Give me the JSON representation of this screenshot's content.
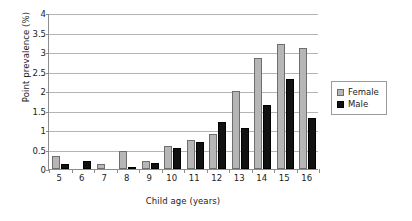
{
  "chart_data": {
    "type": "bar",
    "title": "",
    "xlabel": "Child age (years)",
    "ylabel": "Point prevalence (%)",
    "categories": [
      "5",
      "6",
      "7",
      "8",
      "9",
      "10",
      "11",
      "12",
      "13",
      "14",
      "15",
      "16"
    ],
    "series": [
      {
        "name": "Female",
        "color": "#b6b6b6",
        "values": [
          0.33,
          0.0,
          0.13,
          0.45,
          0.2,
          0.6,
          0.75,
          0.9,
          2.0,
          2.85,
          3.2,
          3.1
        ]
      },
      {
        "name": "Male",
        "color": "#111111",
        "values": [
          0.13,
          0.2,
          0.0,
          0.05,
          0.15,
          0.55,
          0.7,
          1.2,
          1.05,
          1.65,
          2.3,
          1.3
        ]
      }
    ],
    "ylim": [
      0,
      4
    ],
    "y_ticks": [
      "0",
      "0.5",
      "1",
      "1.5",
      "2",
      "2.5",
      "3",
      "3.5",
      "4"
    ],
    "y_tick_values": [
      0,
      0.5,
      1,
      1.5,
      2,
      2.5,
      3,
      3.5,
      4
    ],
    "grid": true,
    "legend_position": "right"
  },
  "legend": {
    "entries": [
      {
        "label": "Female"
      },
      {
        "label": "Male"
      }
    ]
  }
}
